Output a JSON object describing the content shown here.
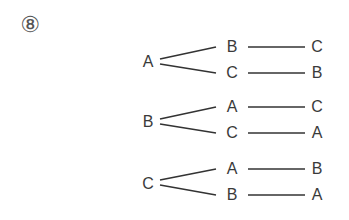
{
  "problem_number": "⑧",
  "trees": [
    {
      "root": "A",
      "branches": [
        {
          "second": "B",
          "third": "C"
        },
        {
          "second": "C",
          "third": "B"
        }
      ]
    },
    {
      "root": "B",
      "branches": [
        {
          "second": "A",
          "third": "C"
        },
        {
          "second": "C",
          "third": "A"
        }
      ]
    },
    {
      "root": "C",
      "branches": [
        {
          "second": "A",
          "third": "B"
        },
        {
          "second": "B",
          "third": "A"
        }
      ]
    }
  ],
  "colors": {
    "line": "#333333",
    "text": "#3a3a3a"
  }
}
